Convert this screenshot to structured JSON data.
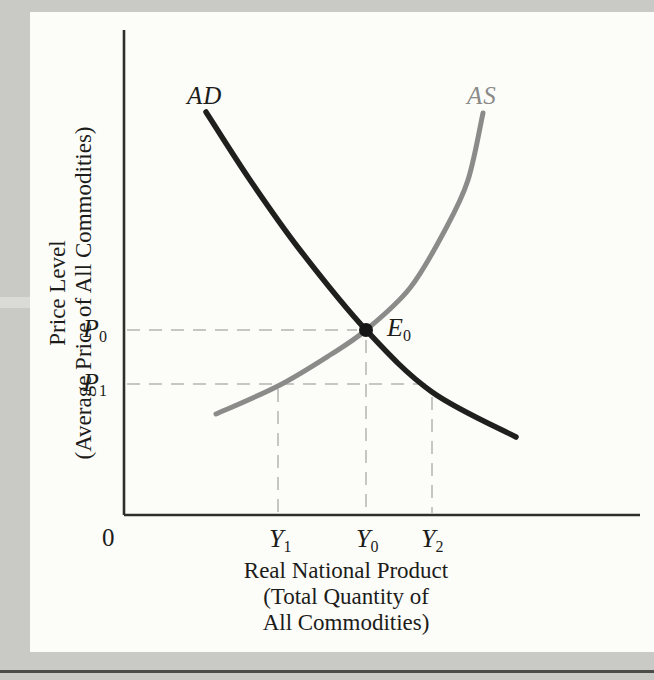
{
  "figure": {
    "y_axis_title_line1": "Price Level",
    "y_axis_title_line2": "(Average Price of All Commodities)",
    "x_axis_title_line1": "Real National Product",
    "x_axis_title_line2": "(Total Quantity of",
    "x_axis_title_line3": "All Commodities)",
    "origin_label": "0"
  },
  "labels": {
    "ad": "AD",
    "as": "AS",
    "e0": {
      "base": "E",
      "sub": "0"
    },
    "p0": {
      "base": "P",
      "sub": "0"
    },
    "p1": {
      "base": "P",
      "sub": "1"
    },
    "y1": {
      "base": "Y",
      "sub": "1"
    },
    "y0": {
      "base": "Y",
      "sub": "0"
    },
    "y2": {
      "base": "Y",
      "sub": "2"
    }
  },
  "chart_data": {
    "type": "line",
    "title": "",
    "xlabel": "Real National Product (Total Quantity of All Commodities)",
    "ylabel": "Price Level (Average Price of All Commodities)",
    "x_tick_labels": [
      "Y1",
      "Y0",
      "Y2"
    ],
    "y_tick_labels": [
      "P0",
      "P1"
    ],
    "origin_label": "0",
    "key_points": {
      "equilibrium": {
        "label": "E0",
        "x": "Y0",
        "y": "P0"
      },
      "as_at_p1": {
        "x": "Y1",
        "y": "P1"
      },
      "ad_at_p1": {
        "x": "Y2",
        "y": "P1"
      }
    },
    "series": [
      {
        "name": "AD",
        "direction": "downward-sloping",
        "color": "#1f1f1d",
        "width": 5.5,
        "points_px": [
          [
            206,
            112
          ],
          [
            250,
            180
          ],
          [
            300,
            250
          ],
          [
            366,
            330
          ],
          [
            432,
            392
          ],
          [
            516,
            437
          ]
        ]
      },
      {
        "name": "AS",
        "direction": "upward-sloping",
        "color": "#8b8b89",
        "width": 5,
        "points_px": [
          [
            216,
            414
          ],
          [
            278,
            386
          ],
          [
            330,
            355
          ],
          [
            366,
            330
          ],
          [
            410,
            288
          ],
          [
            445,
            230
          ],
          [
            468,
            180
          ],
          [
            483,
            113
          ]
        ]
      }
    ],
    "equilibrium_px": [
      366,
      330
    ],
    "equilibrium_dot_radius": 7,
    "guides": [
      {
        "name": "p0-horizontal",
        "from": [
          127,
          330
        ],
        "to": [
          357,
          330
        ]
      },
      {
        "name": "p1-horizontal",
        "from": [
          127,
          384
        ],
        "to": [
          428,
          384
        ]
      },
      {
        "name": "y1-vertical",
        "from": [
          278,
          389
        ],
        "to": [
          278,
          513
        ]
      },
      {
        "name": "y0-vertical",
        "from": [
          366,
          340
        ],
        "to": [
          366,
          513
        ]
      },
      {
        "name": "y2-vertical",
        "from": [
          432,
          397
        ],
        "to": [
          432,
          513
        ]
      }
    ],
    "axes_px": {
      "y_axis": [
        [
          124,
          30
        ],
        [
          124,
          515
        ]
      ],
      "x_axis": [
        [
          124,
          515
        ],
        [
          640,
          515
        ]
      ]
    },
    "colors": {
      "dashed": "#c6c6c2",
      "axis": "#2e2e2c",
      "dot": "#161616"
    },
    "axis_width": 2.6,
    "dash_pattern": "13 9",
    "legend": "none",
    "grid": "off"
  }
}
